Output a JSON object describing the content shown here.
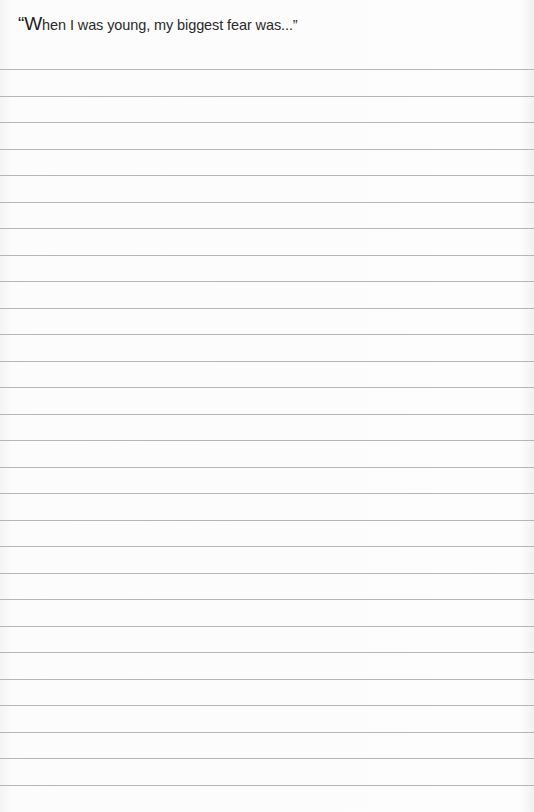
{
  "prompt": {
    "open_quote": "“",
    "first_letter": "W",
    "rest": "hen I was young, my biggest fear was...”"
  },
  "ruled_lines": {
    "count": 28,
    "first_y": 69,
    "spacing": 26.5,
    "color": "#a9a9a9"
  }
}
